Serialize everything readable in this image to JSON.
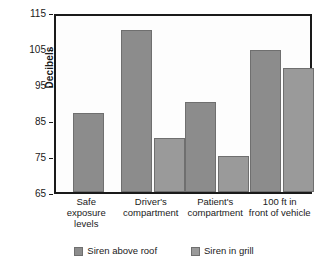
{
  "chart_data": {
    "type": "bar",
    "title": "",
    "xlabel": "",
    "ylabel": "Decibels",
    "ylim": [
      65,
      115
    ],
    "yticks": [
      65,
      75,
      85,
      95,
      105,
      115
    ],
    "grid": false,
    "legend_position": "bottom",
    "categories": [
      "Safe\nexposure\nlevels",
      "Driver's\ncompartment",
      "Patient's\ncompartment",
      "100 ft in\nfront of vehicle"
    ],
    "category_lines": [
      [
        "Safe",
        "exposure",
        "levels"
      ],
      [
        "Driver's",
        "compartment"
      ],
      [
        "Patient's",
        "compartment"
      ],
      [
        "100 ft in",
        "front of vehicle"
      ]
    ],
    "series": [
      {
        "name": "Siren above roof",
        "color": "#8c8c8c",
        "values": [
          87,
          110,
          90,
          104.5
        ]
      },
      {
        "name": "Siren in grill",
        "color": "#9a9a9a",
        "values": [
          null,
          80,
          75,
          99.5
        ]
      }
    ]
  },
  "axis": {
    "y_title": "Decibels",
    "tick_labels": [
      "115",
      "105",
      "95",
      "85",
      "75",
      "65"
    ]
  },
  "legend": {
    "items": [
      {
        "label": "Siren above roof",
        "swatch": "series-1-swatch"
      },
      {
        "label": "Siren in grill",
        "swatch": "series-2-swatch"
      }
    ]
  }
}
